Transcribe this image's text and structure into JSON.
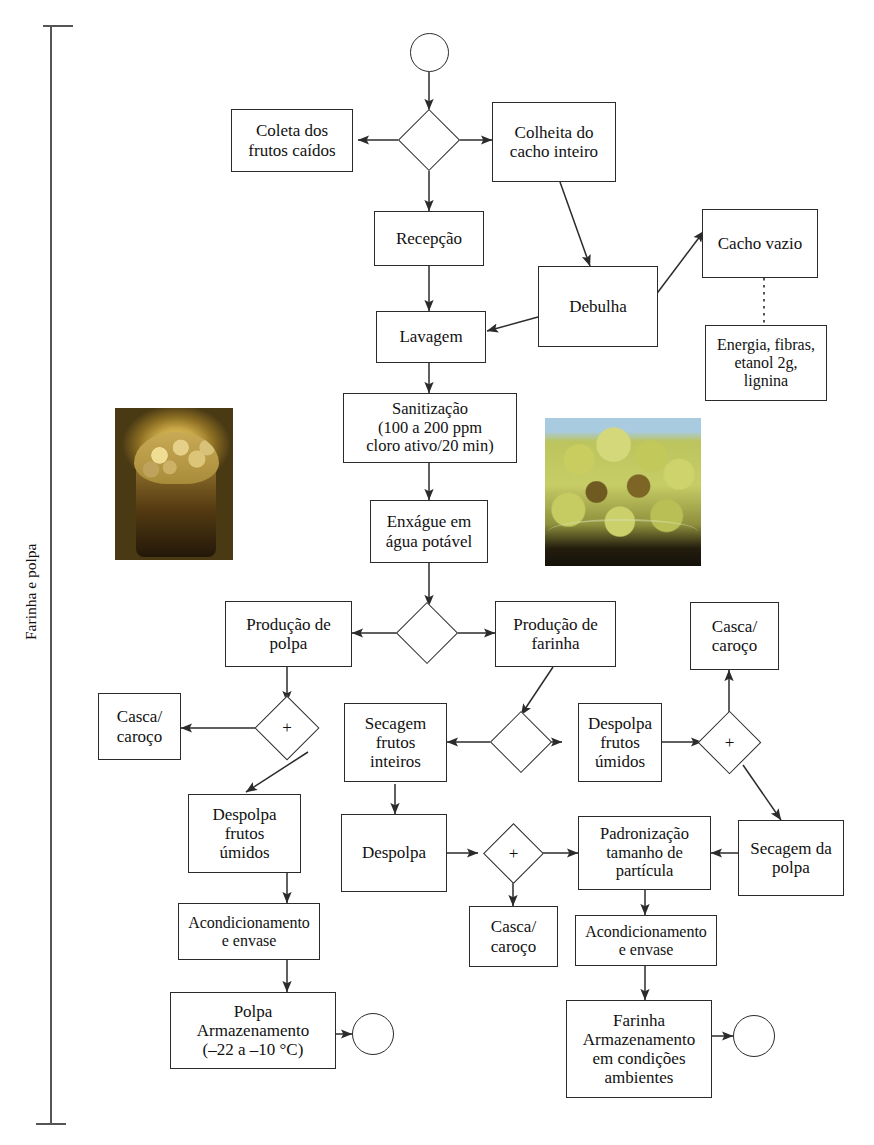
{
  "diagram": {
    "title_vertical": "Farinha e polpa",
    "type": "process-flowchart",
    "language": "pt-BR",
    "colors": {
      "stroke": "#2b2b2b",
      "text": "#111111",
      "background": "#ffffff",
      "bracket": "#555555"
    },
    "nodes": [
      {
        "id": "start",
        "shape": "circle",
        "label": ""
      },
      {
        "id": "d-harvest",
        "shape": "diamond",
        "label": ""
      },
      {
        "id": "coleta",
        "shape": "box",
        "label": "Coleta dos\nfrutos caídos"
      },
      {
        "id": "colheita",
        "shape": "box",
        "label": "Colheita do\ncacho inteiro"
      },
      {
        "id": "recepcao",
        "shape": "box",
        "label": "Recepção"
      },
      {
        "id": "debulha",
        "shape": "box",
        "label": "Debulha"
      },
      {
        "id": "cacho-vazio",
        "shape": "box",
        "label": "Cacho vazio"
      },
      {
        "id": "energia",
        "shape": "box",
        "label": "Energia, fibras,\netanol 2g,\nlignina"
      },
      {
        "id": "lavagem",
        "shape": "box",
        "label": "Lavagem"
      },
      {
        "id": "sanitizacao",
        "shape": "box",
        "label": "Sanitização\n(100 a 200 ppm\ncloro ativo/20 min)"
      },
      {
        "id": "enxague",
        "shape": "box",
        "label": "Enxágue em\nágua potável"
      },
      {
        "id": "d-producao",
        "shape": "diamond",
        "label": ""
      },
      {
        "id": "prod-polpa",
        "shape": "box",
        "label": "Produção de\npolpa"
      },
      {
        "id": "prod-farinha",
        "shape": "box",
        "label": "Produção de\nfarinha"
      },
      {
        "id": "d-plus-polpa",
        "shape": "diamond",
        "label": "+"
      },
      {
        "id": "casca-esq",
        "shape": "box",
        "label": "Casca/\ncaroço"
      },
      {
        "id": "despolpa-umidos-esq",
        "shape": "box",
        "label": "Despolpa\nfrutos\númidos"
      },
      {
        "id": "acond-polpa",
        "shape": "box",
        "label": "Acondicionamento\ne envase"
      },
      {
        "id": "polpa-armaz",
        "shape": "box",
        "label": "Polpa\nArmazenamento\n(–22 a –10 °C)"
      },
      {
        "id": "end-polpa",
        "shape": "circle",
        "label": ""
      },
      {
        "id": "d-farinha-rota",
        "shape": "diamond",
        "label": ""
      },
      {
        "id": "secagem-inteiros",
        "shape": "box",
        "label": "Secagem\nfrutos\ninteiros"
      },
      {
        "id": "despolpa",
        "shape": "box",
        "label": "Despolpa"
      },
      {
        "id": "d-plus-despolpa",
        "shape": "diamond",
        "label": "+"
      },
      {
        "id": "casca-centro",
        "shape": "box",
        "label": "Casca/\ncaroço"
      },
      {
        "id": "despolpa-umidos-dir",
        "shape": "box",
        "label": "Despolpa\nfrutos\númidos"
      },
      {
        "id": "d-plus-dir",
        "shape": "diamond",
        "label": "+"
      },
      {
        "id": "casca-dir",
        "shape": "box",
        "label": "Casca/\ncaroço"
      },
      {
        "id": "secagem-polpa",
        "shape": "box",
        "label": "Secagem da\npolpa"
      },
      {
        "id": "padronizacao",
        "shape": "box",
        "label": "Padronização\ntamanho de\npartícula"
      },
      {
        "id": "acond-farinha",
        "shape": "box",
        "label": "Acondicionamento\ne envase"
      },
      {
        "id": "farinha-armaz",
        "shape": "box",
        "label": "Farinha\nArmazenamento\nem condições\nambientes"
      },
      {
        "id": "end-farinha",
        "shape": "circle",
        "label": ""
      }
    ],
    "edges": [
      {
        "from": "start",
        "to": "d-harvest",
        "style": "solid"
      },
      {
        "from": "d-harvest",
        "to": "coleta",
        "style": "solid"
      },
      {
        "from": "d-harvest",
        "to": "colheita",
        "style": "solid"
      },
      {
        "from": "d-harvest",
        "to": "recepcao",
        "style": "solid"
      },
      {
        "from": "colheita",
        "to": "debulha",
        "style": "solid"
      },
      {
        "from": "debulha",
        "to": "cacho-vazio",
        "style": "solid"
      },
      {
        "from": "cacho-vazio",
        "to": "energia",
        "style": "dotted"
      },
      {
        "from": "debulha",
        "to": "lavagem",
        "style": "solid"
      },
      {
        "from": "recepcao",
        "to": "lavagem",
        "style": "solid"
      },
      {
        "from": "lavagem",
        "to": "sanitizacao",
        "style": "solid"
      },
      {
        "from": "sanitizacao",
        "to": "enxague",
        "style": "solid"
      },
      {
        "from": "enxague",
        "to": "d-producao",
        "style": "solid"
      },
      {
        "from": "d-producao",
        "to": "prod-polpa",
        "style": "solid"
      },
      {
        "from": "d-producao",
        "to": "prod-farinha",
        "style": "solid"
      },
      {
        "from": "prod-polpa",
        "to": "d-plus-polpa",
        "style": "solid"
      },
      {
        "from": "d-plus-polpa",
        "to": "casca-esq",
        "style": "solid"
      },
      {
        "from": "d-plus-polpa",
        "to": "despolpa-umidos-esq",
        "style": "solid"
      },
      {
        "from": "despolpa-umidos-esq",
        "to": "acond-polpa",
        "style": "solid"
      },
      {
        "from": "acond-polpa",
        "to": "polpa-armaz",
        "style": "solid"
      },
      {
        "from": "polpa-armaz",
        "to": "end-polpa",
        "style": "solid"
      },
      {
        "from": "prod-farinha",
        "to": "d-farinha-rota",
        "style": "solid"
      },
      {
        "from": "d-farinha-rota",
        "to": "secagem-inteiros",
        "style": "solid"
      },
      {
        "from": "d-farinha-rota",
        "to": "despolpa-umidos-dir",
        "style": "solid"
      },
      {
        "from": "secagem-inteiros",
        "to": "despolpa",
        "style": "solid"
      },
      {
        "from": "despolpa",
        "to": "d-plus-despolpa",
        "style": "solid"
      },
      {
        "from": "d-plus-despolpa",
        "to": "casca-centro",
        "style": "solid"
      },
      {
        "from": "d-plus-despolpa",
        "to": "padronizacao",
        "style": "solid"
      },
      {
        "from": "despolpa-umidos-dir",
        "to": "d-plus-dir",
        "style": "solid"
      },
      {
        "from": "d-plus-dir",
        "to": "casca-dir",
        "style": "solid"
      },
      {
        "from": "d-plus-dir",
        "to": "secagem-polpa",
        "style": "solid"
      },
      {
        "from": "secagem-polpa",
        "to": "padronizacao",
        "style": "solid"
      },
      {
        "from": "padronizacao",
        "to": "acond-farinha",
        "style": "solid"
      },
      {
        "from": "acond-farinha",
        "to": "farinha-armaz",
        "style": "solid"
      },
      {
        "from": "farinha-armaz",
        "to": "end-farinha",
        "style": "solid"
      }
    ],
    "photos": [
      {
        "id": "photo-polpa",
        "caption": "",
        "description": "polpa de bacuri em copo"
      },
      {
        "id": "photo-farinha",
        "caption": "",
        "description": "farinha amarelada em recipiente"
      }
    ]
  }
}
